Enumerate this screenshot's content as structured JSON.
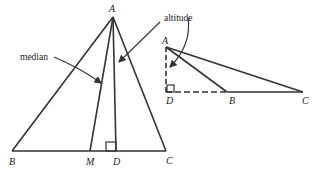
{
  "figure_left": {
    "vertices": {
      "A": "A",
      "B": "B",
      "C": "C",
      "M": "M",
      "D": "D"
    },
    "annotations": {
      "median": "median",
      "altitude": "altitude"
    }
  },
  "figure_right": {
    "vertices": {
      "A": "A",
      "D": "D",
      "B": "B",
      "C": "C"
    }
  },
  "colors": {
    "stroke": "#333333",
    "text": "#222222",
    "background": "#ffffff"
  }
}
